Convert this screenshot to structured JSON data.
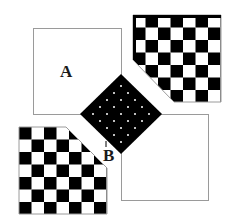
{
  "diagram": {
    "labels": {
      "a": "A",
      "b": "B"
    },
    "colors": {
      "ink": "#000000",
      "paper": "#ffffff",
      "outline": "#9a9a9a",
      "dot": "#ffffff"
    },
    "shapes": {
      "square_a": {
        "x": 33,
        "y": 28,
        "size": 88
      },
      "square_bottom_right": {
        "x": 121,
        "y": 114,
        "size": 87
      },
      "diamond": {
        "cx": 121,
        "cy": 114,
        "half": 41,
        "dot_grid": 5
      },
      "checker_top_right": {
        "x": 133,
        "y": 15,
        "size": 88,
        "cells": 7
      },
      "checker_bottom_left": {
        "x": 19,
        "y": 127,
        "size": 88,
        "cells": 7
      }
    }
  }
}
